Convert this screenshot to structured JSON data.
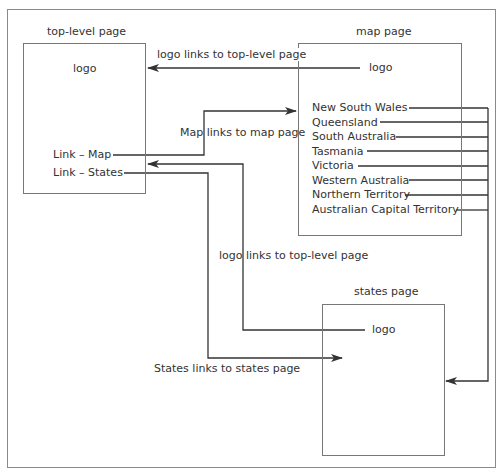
{
  "diagram": {
    "pages": {
      "top_level": {
        "title": "top-level page",
        "logo": "logo",
        "link_map": "Link – Map",
        "link_states": "Link – States"
      },
      "map": {
        "title": "map page",
        "logo": "logo",
        "states": [
          "New South Wales",
          "Queensland",
          "South Australia",
          "Tasmania",
          "Victoria",
          "Western Australia",
          "Northern Territory",
          "Australian Capital Territory"
        ]
      },
      "states": {
        "title": "states page",
        "logo": "logo"
      }
    },
    "edge_labels": {
      "map_logo_to_top": "logo links to top-level page",
      "map_link": "Map links to map page",
      "states_logo_to_top": "logo links to top-level page",
      "states_link": "States links to states page"
    },
    "colors": {
      "line": "#333333",
      "box_border": "#777777",
      "frame_border": "#8a8a8a"
    }
  }
}
